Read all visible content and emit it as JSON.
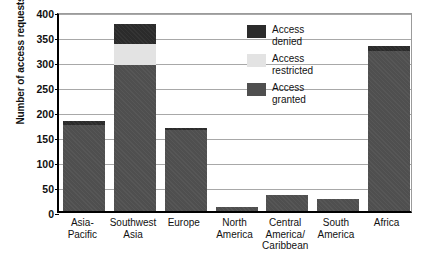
{
  "chart_data": {
    "type": "bar",
    "subtype": "stacked",
    "title": "",
    "xlabel": "",
    "ylabel": "Number of access requests",
    "ylim": [
      0,
      400
    ],
    "ytick_step": 50,
    "yticks": [
      "400",
      "350",
      "300",
      "250",
      "200",
      "150",
      "100",
      "50",
      "0"
    ],
    "grid": true,
    "legend_position": "inside-top-right",
    "categories": [
      "Asia-\nPacific",
      "Southwest\nAsia",
      "Europe",
      "North\nAmerica",
      "Central\nAmerica/\nCaribbean",
      "South\nAmerica",
      "Africa"
    ],
    "series": [
      {
        "name": "Access granted",
        "color": "#4f4f4f",
        "values": [
          172,
          292,
          162,
          8,
          33,
          25,
          320
        ]
      },
      {
        "name": "Access restricted",
        "color": "#e3e3e3",
        "values": [
          0,
          43,
          0,
          0,
          0,
          0,
          0
        ]
      },
      {
        "name": "Access denied",
        "color": "#2b2b2b",
        "values": [
          8,
          40,
          4,
          0,
          0,
          0,
          10
        ]
      }
    ],
    "totals": [
      180,
      375,
      166,
      8,
      33,
      25,
      330
    ]
  },
  "legend": {
    "items": [
      {
        "label_line1": "Access",
        "label_line2": "denied",
        "color": "#2b2b2b"
      },
      {
        "label_line1": "Access",
        "label_line2": "restricted",
        "color": "#e3e3e3"
      },
      {
        "label_line1": "Access",
        "label_line2": "granted",
        "color": "#4f4f4f"
      }
    ]
  }
}
